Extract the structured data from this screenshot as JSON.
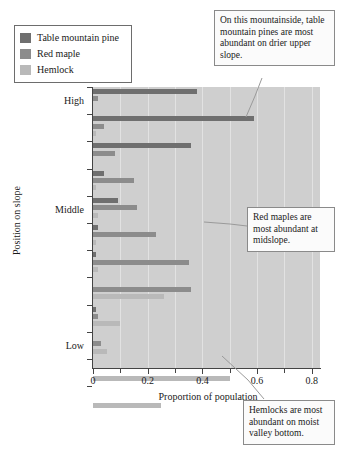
{
  "legend": {
    "items": [
      {
        "label": "Table mountain pine",
        "color": "#6f6f6f",
        "key": "pine"
      },
      {
        "label": "Red maple",
        "color": "#8c8c8c",
        "key": "maple"
      },
      {
        "label": "Hemlock",
        "color": "#b9b9b9",
        "key": "hemlock"
      }
    ]
  },
  "callouts": [
    {
      "name": "callout-pine",
      "text": "On this mountainside, table mountain pines are most abundant on drier upper slope."
    },
    {
      "name": "callout-maple",
      "text": "Red maples are most abundant at midslope."
    },
    {
      "name": "callout-hemlock",
      "text": "Hemlocks are most abundant on moist valley bottom."
    }
  ],
  "chart_data": {
    "type": "bar",
    "orientation": "horizontal",
    "title": "",
    "xlabel": "Proportion of population",
    "ylabel": "Position on slope",
    "xlim": [
      0,
      0.83
    ],
    "xticks": [
      0,
      0.1,
      0.2,
      0.3,
      0.4,
      0.5,
      0.6,
      0.7,
      0.8
    ],
    "xticklabels": [
      "0",
      "",
      "0.2",
      "",
      "0.4",
      "",
      "0.6",
      "",
      "0.8"
    ],
    "grid": true,
    "grid_axis": "x",
    "legend_position": "upper-left-outside",
    "ycategories": [
      "1",
      "2",
      "3",
      "4",
      "5",
      "6",
      "7",
      "8",
      "9",
      "10"
    ],
    "yticklabels": {
      "High": 1,
      "Middle": 5,
      "Low": 10
    },
    "series": [
      {
        "name": "Table mountain pine",
        "color": "#6f6f6f",
        "values": [
          0.38,
          0.59,
          0.36,
          0.04,
          0.09,
          0.02,
          0.01,
          0.0,
          0.01,
          0.0
        ]
      },
      {
        "name": "Red maple",
        "color": "#8c8c8c",
        "values": [
          0.02,
          0.04,
          0.08,
          0.0,
          0.03,
          0.23,
          0.35,
          0.36,
          0.02,
          0.03
        ]
      },
      {
        "name": "Hemlock",
        "color": "#b9b9b9",
        "values": [
          0.0,
          0.01,
          0.0,
          0.01,
          0.02,
          0.01,
          0.02,
          0.26,
          0.1,
          0.05
        ]
      }
    ],
    "bars": [
      {
        "group": 1,
        "series": "Table mountain pine",
        "value": 0.38
      },
      {
        "group": 1,
        "series": "Red maple",
        "value": 0.02
      },
      {
        "group": 1,
        "series": "Hemlock",
        "value": 0.0
      },
      {
        "group": 2,
        "series": "Table mountain pine",
        "value": 0.59
      },
      {
        "group": 2,
        "series": "Red maple",
        "value": 0.04
      },
      {
        "group": 2,
        "series": "Hemlock",
        "value": 0.01
      },
      {
        "group": 3,
        "series": "Table mountain pine",
        "value": 0.36
      },
      {
        "group": 3,
        "series": "Red maple",
        "value": 0.08
      },
      {
        "group": 3,
        "series": "Hemlock",
        "value": 0.0
      },
      {
        "group": 4,
        "series": "Table mountain pine",
        "value": 0.04
      },
      {
        "group": 4,
        "series": "Red maple",
        "value": 0.15
      },
      {
        "group": 4,
        "series": "Hemlock",
        "value": 0.01
      },
      {
        "group": 5,
        "series": "Table mountain pine",
        "value": 0.09
      },
      {
        "group": 5,
        "series": "Red maple",
        "value": 0.16
      },
      {
        "group": 5,
        "series": "Hemlock",
        "value": 0.02
      },
      {
        "group": 6,
        "series": "Table mountain pine",
        "value": 0.02
      },
      {
        "group": 6,
        "series": "Red maple",
        "value": 0.23
      },
      {
        "group": 6,
        "series": "Hemlock",
        "value": 0.01
      },
      {
        "group": 7,
        "series": "Table mountain pine",
        "value": 0.01
      },
      {
        "group": 7,
        "series": "Red maple",
        "value": 0.35
      },
      {
        "group": 7,
        "series": "Hemlock",
        "value": 0.02
      },
      {
        "group": 8,
        "series": "Table mountain pine",
        "value": 0.0
      },
      {
        "group": 8,
        "series": "Red maple",
        "value": 0.36
      },
      {
        "group": 8,
        "series": "Hemlock",
        "value": 0.26
      },
      {
        "group": 9,
        "series": "Table mountain pine",
        "value": 0.01
      },
      {
        "group": 9,
        "series": "Red maple",
        "value": 0.02
      },
      {
        "group": 9,
        "series": "Hemlock",
        "value": 0.1
      },
      {
        "group": 10,
        "series": "Table mountain pine",
        "value": 0.0
      },
      {
        "group": 10,
        "series": "Red maple",
        "value": 0.03
      },
      {
        "group": 10,
        "series": "Hemlock",
        "value": 0.05
      },
      {
        "group": 11,
        "series": "Hemlock",
        "value": 0.5
      },
      {
        "group": 12,
        "series": "Hemlock",
        "value": 0.25
      }
    ]
  }
}
